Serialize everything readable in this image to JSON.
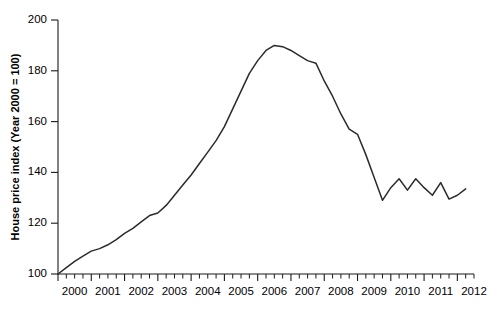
{
  "chart_data": {
    "type": "line",
    "title": "",
    "xlabel": "",
    "ylabel": "House price index (Year 2000 = 100)",
    "xlim": [
      2000.0,
      2012.5
    ],
    "ylim": [
      100,
      200
    ],
    "grid": false,
    "legend": "none",
    "line_color": "#2b2b2b",
    "xticks": [
      2000,
      2001,
      2002,
      2003,
      2004,
      2005,
      2006,
      2007,
      2008,
      2009,
      2010,
      2011,
      2012
    ],
    "xtick_labels": [
      "2000",
      "2001",
      "2002",
      "2003",
      "2004",
      "2005",
      "2006",
      "2007",
      "2008",
      "2009",
      "2010",
      "2011",
      "2012"
    ],
    "minor_xticks_per_year": 4,
    "yticks": [
      100,
      120,
      140,
      160,
      180,
      200
    ],
    "ytick_labels": [
      "100",
      "120",
      "140",
      "160",
      "180",
      "200"
    ],
    "series": [
      {
        "name": "House price index",
        "x": [
          2000.0,
          2000.25,
          2000.5,
          2000.75,
          2001.0,
          2001.25,
          2001.5,
          2001.75,
          2002.0,
          2002.25,
          2002.5,
          2002.75,
          2003.0,
          2003.25,
          2003.5,
          2003.75,
          2004.0,
          2004.25,
          2004.5,
          2004.75,
          2005.0,
          2005.25,
          2005.5,
          2005.75,
          2006.0,
          2006.25,
          2006.5,
          2006.75,
          2007.0,
          2007.25,
          2007.5,
          2007.75,
          2008.0,
          2008.25,
          2008.5,
          2008.75,
          2009.0,
          2009.25,
          2009.5,
          2009.75,
          2010.0,
          2010.25,
          2010.5,
          2010.75,
          2011.0,
          2011.25,
          2011.5,
          2011.75,
          2012.0,
          2012.25
        ],
        "y": [
          100.0,
          102.5,
          105.0,
          107.0,
          109.0,
          110.0,
          111.5,
          113.5,
          116.0,
          118.0,
          120.5,
          123.0,
          124.0,
          127.0,
          131.0,
          135.0,
          139.0,
          143.5,
          148.0,
          152.5,
          158.0,
          165.0,
          172.0,
          179.0,
          184.0,
          188.0,
          190.0,
          189.5,
          188.0,
          186.0,
          184.0,
          183.0,
          176.0,
          170.0,
          163.0,
          157.0,
          155.0,
          147.0,
          138.0,
          129.0,
          134.0,
          137.5,
          133.0,
          137.5,
          134.0,
          131.0,
          136.0,
          129.5,
          131.0,
          133.5
        ]
      }
    ],
    "annotations": []
  }
}
